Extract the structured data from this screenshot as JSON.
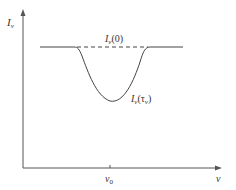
{
  "diagram": {
    "type": "absorption-line-profile",
    "y_axis_label": "I",
    "y_axis_sub": "ν",
    "x_axis_label": "ν",
    "x_tick_label": "ν",
    "x_tick_sub": "0",
    "continuum_label": "I",
    "continuum_label_sub": "ν",
    "continuum_label_arg": "(0)",
    "line_label": "I",
    "line_label_sub": "ν",
    "line_label_arg_open": "(τ",
    "line_label_arg_sub": "ν",
    "line_label_arg_close": ")",
    "colors": {
      "line": "#444444",
      "axis": "#555555"
    }
  }
}
